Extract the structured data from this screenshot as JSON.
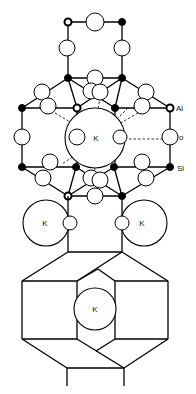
{
  "diagram": {
    "legend": {
      "al_label": "Al",
      "o_label": "o",
      "si_label": "Si"
    },
    "cation_labels": {
      "k_center": "K",
      "k_left": "K",
      "k_right": "K",
      "k_bottom": "K"
    },
    "node_types": {
      "aluminum": "open circle, thick outline",
      "oxygen": "large open circle",
      "silicon": "filled black circle",
      "potassium": "very large open circle labeled K"
    },
    "colors": {
      "stroke": "#000000",
      "background": "#ffffff"
    }
  }
}
